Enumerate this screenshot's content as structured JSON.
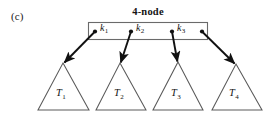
{
  "figure": {
    "panel_label": "(c)",
    "node_title": "4-node",
    "keys": [
      {
        "name": "k1",
        "label": "k",
        "sub": "1"
      },
      {
        "name": "k2",
        "label": "k",
        "sub": "2"
      },
      {
        "name": "k3",
        "label": "k",
        "sub": "3"
      }
    ],
    "subtrees": [
      {
        "name": "T1",
        "label": "T",
        "sub": "1"
      },
      {
        "name": "T2",
        "label": "T",
        "sub": "2"
      },
      {
        "name": "T3",
        "label": "T",
        "sub": "3"
      },
      {
        "name": "T4",
        "label": "T",
        "sub": "4"
      }
    ],
    "colors": {
      "ink": "#141414",
      "line": "#555555",
      "arrow": "#111111",
      "background": "#ffffff"
    },
    "geometry": {
      "node_box": {
        "x": 88,
        "y": 22,
        "width": 120,
        "height": 17
      },
      "child_pointers": [
        {
          "from_x": 95,
          "from_y": 31.5,
          "to_x": 63,
          "to_y": 64
        },
        {
          "from_x": 131,
          "from_y": 31.5,
          "to_x": 120,
          "to_y": 64
        },
        {
          "from_x": 172,
          "from_y": 31.5,
          "to_x": 178,
          "to_y": 63
        },
        {
          "from_x": 202,
          "from_y": 31.5,
          "to_x": 235,
          "to_y": 65
        }
      ],
      "triangles": [
        {
          "apex_x": 63,
          "apex_y": 63,
          "left_x": 38,
          "right_x": 89,
          "base_y": 110
        },
        {
          "apex_x": 120,
          "apex_y": 63,
          "left_x": 96,
          "right_x": 146,
          "base_y": 110
        },
        {
          "apex_x": 178,
          "apex_y": 62,
          "left_x": 153,
          "right_x": 203,
          "base_y": 110
        },
        {
          "apex_x": 236,
          "apex_y": 64,
          "left_x": 212,
          "right_x": 262,
          "base_y": 110
        }
      ]
    }
  }
}
